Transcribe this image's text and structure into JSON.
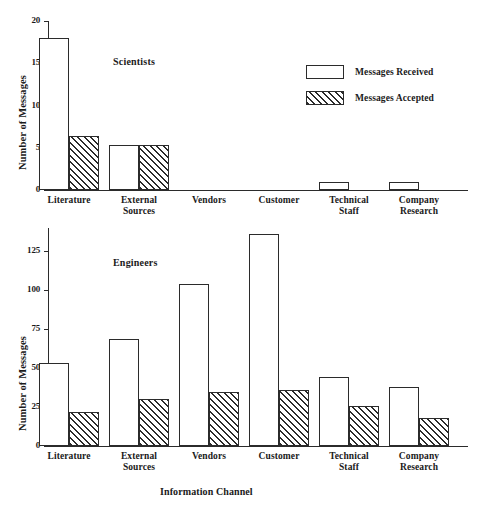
{
  "legend": {
    "items": [
      {
        "label": "Messages Received",
        "style": "open"
      },
      {
        "label": "Messages Accepted",
        "style": "hatched"
      }
    ]
  },
  "axis_label_x": "Information Channel",
  "chart_data": [
    {
      "type": "bar",
      "title": "Scientists",
      "xlabel": "",
      "ylabel": "Number of Messages",
      "categories": [
        "Literature",
        "External\nSources",
        "Vendors",
        "Customer",
        "Technical\nStaff",
        "Company\nResearch"
      ],
      "series": [
        {
          "name": "Messages Received",
          "values": [
            18,
            5.3,
            0,
            0,
            1,
            1
          ]
        },
        {
          "name": "Messages Accepted",
          "values": [
            6.4,
            5.3,
            0,
            0,
            0,
            0
          ]
        }
      ],
      "ylim": [
        0,
        20
      ],
      "yticks": [
        0,
        5,
        10,
        15,
        20
      ],
      "grid": false,
      "legend_position": "top-right"
    },
    {
      "type": "bar",
      "title": "Engineers",
      "xlabel": "Information Channel",
      "ylabel": "Number of Messages",
      "categories": [
        "Literature",
        "External\nSources",
        "Vendors",
        "Customer",
        "Technical\nStaff",
        "Company\nResearch"
      ],
      "series": [
        {
          "name": "Messages Received",
          "values": [
            53,
            69,
            104,
            136,
            44,
            38
          ]
        },
        {
          "name": "Messages Accepted",
          "values": [
            22,
            30,
            35,
            36,
            26,
            18
          ]
        }
      ],
      "ylim": [
        0,
        140
      ],
      "yticks": [
        0,
        25,
        50,
        75,
        100,
        125
      ],
      "grid": false,
      "legend_position": "none"
    }
  ]
}
